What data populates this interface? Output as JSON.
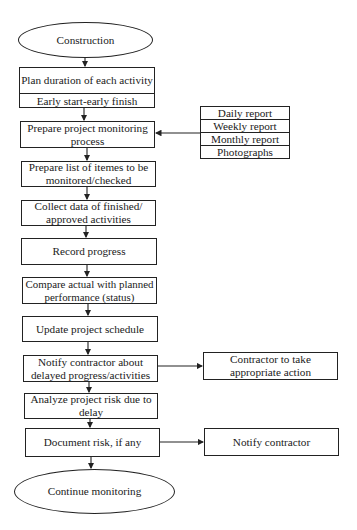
{
  "flowchart": {
    "start": "Construction",
    "plan": {
      "title": "Plan duration of each activity",
      "subtitle": "Early start-early finish"
    },
    "steps": [
      "Prepare project monitoring process",
      "Prepare list of itemes to be monitored/checked",
      "Collect data of finished/ approved activities",
      "Record progress",
      "Compare actual with planned performance (status)",
      "Update project schedule",
      "Notify contractor about delayed progress/activities",
      "Analyze project risk due to delay",
      "Document risk, if any"
    ],
    "end": "Continue monitoring",
    "inputs": [
      "Daily report",
      "Weekly report",
      "Monthly report",
      "Photographs"
    ],
    "side_outputs": {
      "contractor_action": "Contractor to take appropriate action",
      "notify_contractor": "Notify contractor"
    },
    "colors": {
      "line": "#222222",
      "background": "#ffffff"
    }
  }
}
